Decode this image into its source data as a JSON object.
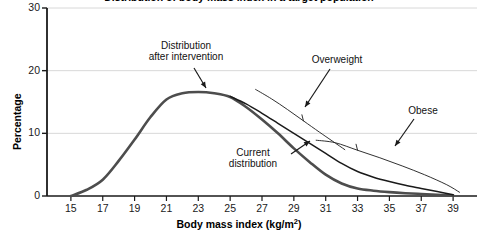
{
  "chart_data": {
    "type": "line",
    "title": "Distribution of body mass index in a target population",
    "title_clipped": true,
    "xlabel": "Body mass index (kg/m²)",
    "ylabel": "Percentage",
    "xlim": [
      13.5,
      40.5
    ],
    "ylim": [
      0,
      30
    ],
    "xticks": [
      15,
      17,
      19,
      21,
      23,
      25,
      27,
      29,
      31,
      33,
      35,
      37,
      39
    ],
    "xtick_labels": [
      "15",
      "17",
      "19",
      "21",
      "23",
      "25",
      "27",
      "29",
      "31",
      "33",
      "35",
      "37",
      "39"
    ],
    "yticks": [
      0,
      10,
      20,
      30
    ],
    "ytick_labels": [
      "0",
      "10",
      "20",
      "30"
    ],
    "grid": "horizontal",
    "legend": "none",
    "series": [
      {
        "name": "Distribution after intervention",
        "color": "#4d4d4d",
        "width": 2.6,
        "x": [
          15.0,
          16.0,
          17.0,
          18.0,
          19.0,
          20.0,
          21.0,
          22.0,
          23.0,
          24.0,
          25.0,
          26.0,
          27.0,
          28.0,
          29.0,
          30.0,
          31.0,
          32.0,
          33.0,
          34.0,
          35.0,
          36.0,
          37.0,
          38.0,
          39.0
        ],
        "y": [
          0.0,
          1.0,
          2.6,
          5.6,
          9.0,
          12.6,
          15.4,
          16.4,
          16.6,
          16.4,
          15.8,
          14.2,
          12.2,
          10.0,
          7.6,
          5.4,
          3.4,
          2.0,
          1.2,
          0.85,
          0.62,
          0.45,
          0.32,
          0.2,
          0.1
        ]
      },
      {
        "name": "Current distribution",
        "color": "#1a1a1a",
        "width": 1.5,
        "x": [
          25.0,
          26.0,
          27.0,
          28.0,
          29.0,
          30.0,
          31.0,
          32.0,
          33.0,
          34.0,
          35.0,
          36.0,
          37.0,
          38.0,
          39.0
        ],
        "y": [
          15.9,
          14.7,
          13.2,
          11.6,
          10.0,
          8.4,
          6.8,
          5.2,
          3.9,
          3.0,
          2.3,
          1.7,
          1.2,
          0.7,
          0.2
        ]
      }
    ],
    "brackets": [
      {
        "name": "overweight-bracket",
        "x": [
          26.6,
          27.6,
          28.6,
          29.6,
          30.6,
          31.4,
          32.2
        ],
        "y": [
          17.0,
          15.5,
          13.8,
          12.0,
          10.2,
          8.8,
          7.4
        ],
        "notch_index": 3
      },
      {
        "name": "obese-bracket",
        "x": [
          30.4,
          31.6,
          33.0,
          34.4,
          35.8,
          37.2,
          38.6,
          39.4
        ],
        "y": [
          8.9,
          8.5,
          7.3,
          6.1,
          4.8,
          3.4,
          1.8,
          0.6
        ],
        "notch_index": 2
      }
    ],
    "annotations": [
      {
        "name": "distribution-after-intervention",
        "lines": [
          "Distribution",
          "after intervention"
        ],
        "label_x_px": 186,
        "label_y_px": 40,
        "arrow_from_px": [
          194,
          68
        ],
        "arrow_to_px": [
          206,
          88
        ]
      },
      {
        "name": "overweight",
        "lines": [
          "Overweight"
        ],
        "label_x_px": 337,
        "label_y_px": 54,
        "arrow_from_px": [
          330,
          69
        ],
        "arrow_to_px": [
          305,
          107
        ]
      },
      {
        "name": "current-distribution",
        "lines": [
          "Current",
          "distribution"
        ],
        "label_x_px": 253,
        "label_y_px": 147,
        "arrow_from_px": [
          291,
          154
        ],
        "arrow_to_px": [
          310,
          141
        ]
      },
      {
        "name": "obese",
        "lines": [
          "Obese"
        ],
        "label_x_px": 423,
        "label_y_px": 105,
        "arrow_from_px": [
          414,
          119
        ],
        "arrow_to_px": [
          395,
          146
        ]
      }
    ],
    "colors": {
      "background": "#ffffff",
      "axis": "#1a1a1a",
      "grid": "#d8d8d8",
      "intervention_curve": "#4d4d4d",
      "current_curve": "#1a1a1a",
      "text": "#000000"
    }
  }
}
